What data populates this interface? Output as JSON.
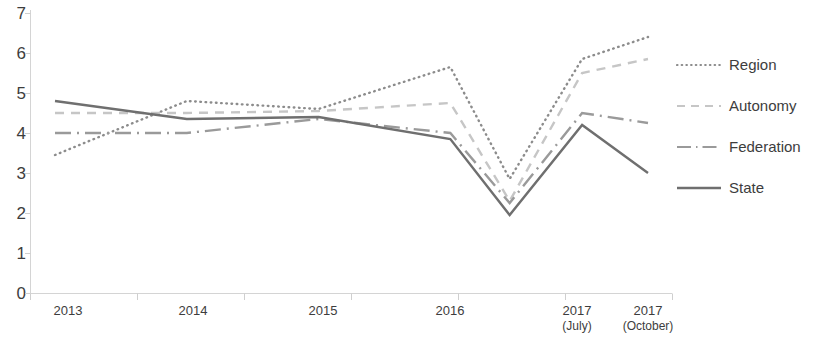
{
  "chart_data": {
    "type": "line",
    "title": "",
    "xlabel": "",
    "ylabel": "",
    "ylim": [
      0,
      7
    ],
    "ytick_labels": [
      "7",
      "6",
      "5",
      "4",
      "3",
      "2",
      "1",
      "0"
    ],
    "ytick_values": [
      7,
      6,
      5,
      4,
      3,
      2,
      1,
      0
    ],
    "grid": false,
    "legend_position": "right",
    "categories": [
      "2013",
      "2014",
      "2015",
      "2016",
      "",
      "2017",
      "2017"
    ],
    "category_sublabels": [
      "",
      "",
      "",
      "",
      "",
      "(July)",
      "(October)"
    ],
    "x": [
      0,
      1,
      2,
      3,
      3.45,
      4,
      4.5
    ],
    "series": [
      {
        "name": "Region",
        "style": "dotted",
        "color": "#8c8c8c",
        "values": [
          3.45,
          4.8,
          4.6,
          5.65,
          2.85,
          5.85,
          6.4
        ]
      },
      {
        "name": "Autonomy",
        "style": "dashed",
        "color": "#c6c6c6",
        "values": [
          4.5,
          4.5,
          4.55,
          4.75,
          2.3,
          5.5,
          5.85
        ]
      },
      {
        "name": "Federation",
        "style": "dashdot",
        "color": "#9a9a9a",
        "values": [
          4.0,
          4.0,
          4.35,
          4.0,
          2.25,
          4.5,
          4.25
        ]
      },
      {
        "name": "State",
        "style": "solid",
        "color": "#6f6f6f",
        "values": [
          4.8,
          4.35,
          4.4,
          3.85,
          1.95,
          4.2,
          3.0
        ]
      }
    ]
  },
  "legend": {
    "items": [
      {
        "label": "Region"
      },
      {
        "label": "Autonomy"
      },
      {
        "label": "Federation"
      },
      {
        "label": "State"
      }
    ]
  },
  "axes": {
    "axis_color": "#d2d2d2",
    "tick_color": "#cfcfcf"
  }
}
